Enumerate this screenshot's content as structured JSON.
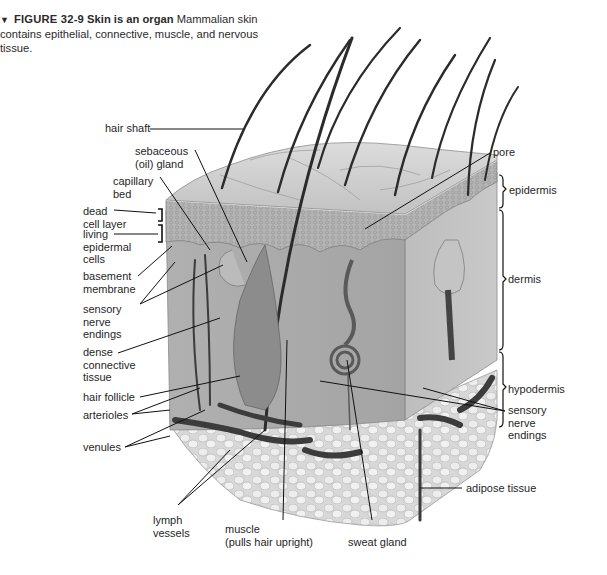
{
  "caption": {
    "marker": "▼",
    "figure_number": "FIGURE 32-9",
    "title": "Skin is an organ",
    "text": "Mammalian skin contains epithelial, connective, muscle, and nervous tissue."
  },
  "colors": {
    "background": "#ffffff",
    "label_text": "#1f1f1f",
    "leader_line": "#111111",
    "epidermis_fill": "#b8b8b8",
    "dermis_fill": "#a9a9a9",
    "adipose_fill": "#e6e6e6",
    "vessel_fill": "#444444",
    "hair": "#2b2b2b"
  },
  "labels": {
    "left": [
      {
        "id": "hair-shaft",
        "text": "hair shaft"
      },
      {
        "id": "sebaceous-gland",
        "text": "sebaceous\n(oil) gland"
      },
      {
        "id": "capillary-bed",
        "text": "capillary\nbed"
      },
      {
        "id": "dead-cell-layer",
        "text": "dead\ncell layer"
      },
      {
        "id": "living-epidermal-cells",
        "text": "living\nepidermal\ncells"
      },
      {
        "id": "basement-membrane",
        "text": "basement\nmembrane"
      },
      {
        "id": "sensory-nerve-endings-left",
        "text": "sensory\nnerve\nendings"
      },
      {
        "id": "dense-connective-tissue",
        "text": "dense\nconnective\ntissue"
      },
      {
        "id": "hair-follicle",
        "text": "hair follicle"
      },
      {
        "id": "arterioles",
        "text": "arterioles"
      },
      {
        "id": "venules",
        "text": "venules"
      }
    ],
    "right": [
      {
        "id": "pore",
        "text": "pore"
      },
      {
        "id": "epidermis",
        "text": "epidermis"
      },
      {
        "id": "dermis",
        "text": "dermis"
      },
      {
        "id": "hypodermis",
        "text": "hypodermis"
      },
      {
        "id": "sensory-nerve-endings-right",
        "text": "sensory\nnerve\nendings"
      },
      {
        "id": "adipose-tissue",
        "text": "adipose tissue"
      }
    ],
    "bottom": [
      {
        "id": "lymph-vessels",
        "text": "lymph\nvessels"
      },
      {
        "id": "muscle",
        "text": "muscle\n(pulls hair upright)"
      },
      {
        "id": "sweat-gland",
        "text": "sweat gland"
      }
    ]
  }
}
